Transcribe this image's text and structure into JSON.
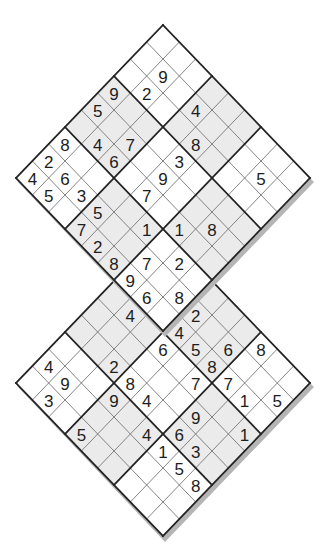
{
  "puzzle": {
    "type": "double-diamond-sudoku",
    "size": 9,
    "box": 3,
    "shaded_boxes": [
      [
        0,
        1
      ],
      [
        1,
        0
      ],
      [
        1,
        2
      ],
      [
        2,
        1
      ]
    ],
    "overlap": "top grid bottom box (rows 6-8, cols 6-8) == lower grid top box (rows 0-2, cols 0-2)",
    "colors": {
      "shade": "#ebebeb",
      "thin_line": "#666666",
      "thick_line": "#222222",
      "digit": "#1e1e1e",
      "shadow": "#b5b5b5"
    },
    "grids": [
      {
        "name": "top-grid",
        "top_vertex": [
          163,
          25
        ],
        "cells": [
          [
            0,
            0,
            0,
            0,
            0,
            0,
            0,
            0,
            0
          ],
          [
            0,
            9,
            0,
            4,
            0,
            0,
            0,
            5,
            0
          ],
          [
            0,
            2,
            0,
            0,
            8,
            0,
            0,
            0,
            0
          ],
          [
            9,
            0,
            0,
            0,
            3,
            0,
            0,
            0,
            0
          ],
          [
            5,
            0,
            7,
            0,
            9,
            0,
            0,
            8,
            0
          ],
          [
            0,
            4,
            6,
            0,
            7,
            0,
            1,
            0,
            0
          ],
          [
            8,
            0,
            0,
            0,
            0,
            1,
            0,
            2,
            0
          ],
          [
            2,
            6,
            3,
            5,
            0,
            0,
            7,
            0,
            8
          ],
          [
            4,
            5,
            0,
            7,
            2,
            8,
            9,
            6,
            0
          ]
        ]
      },
      {
        "name": "bottom-grid",
        "top_vertex": [
          163,
          230
        ],
        "cells": [
          [
            0,
            2,
            0,
            0,
            0,
            0,
            8,
            0,
            0
          ],
          [
            7,
            0,
            8,
            2,
            0,
            6,
            0,
            0,
            5
          ],
          [
            9,
            6,
            0,
            4,
            5,
            8,
            7,
            1,
            0
          ],
          [
            0,
            4,
            0,
            6,
            0,
            7,
            0,
            0,
            1
          ],
          [
            0,
            0,
            0,
            0,
            0,
            0,
            9,
            0,
            0
          ],
          [
            0,
            0,
            2,
            8,
            4,
            0,
            6,
            3,
            0
          ],
          [
            0,
            0,
            0,
            9,
            0,
            4,
            1,
            5,
            8
          ],
          [
            4,
            9,
            0,
            0,
            0,
            0,
            0,
            0,
            0
          ],
          [
            0,
            3,
            0,
            5,
            0,
            0,
            0,
            0,
            0
          ]
        ]
      }
    ]
  }
}
